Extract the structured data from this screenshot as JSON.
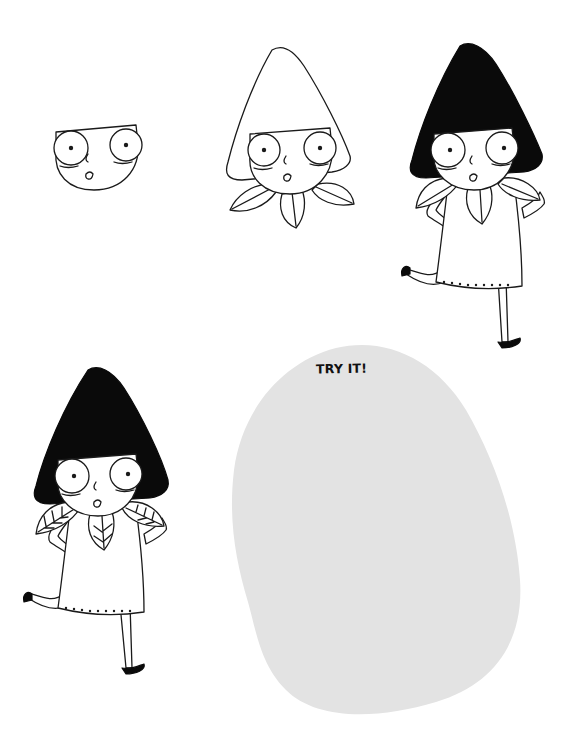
{
  "page": {
    "background": "#ffffff",
    "ink_color": "#1a1a1a",
    "hair_color": "#0a0a0a"
  },
  "steps": [
    {
      "step": 1,
      "description": "Face with big round eyes, nose and small open mouth"
    },
    {
      "step": 2,
      "description": "Add cone-shaped hair outline and leaf collar"
    },
    {
      "step": 3,
      "description": "Fill hair black, add dress, arms and running legs"
    },
    {
      "step": 4,
      "description": "Finished character with veined leaf collar"
    }
  ],
  "practice_area": {
    "label": "TRY IT!",
    "fill_color": "#e3e3e3"
  }
}
